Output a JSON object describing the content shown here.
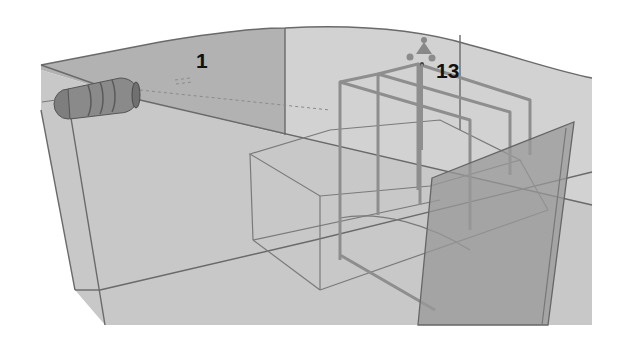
{
  "scene": {
    "type": "3d-render",
    "colors": {
      "background": "#ffffff",
      "floor": "#c9c9c9",
      "back_wall": "#b4b4b4",
      "right_wall": "#d0d0d0",
      "panel": "#9a9a9a",
      "edge": "#6a6a6a",
      "frame": "#8c8c8c",
      "label": "#111111"
    },
    "labels": [
      {
        "id": "camera",
        "text": "1"
      },
      {
        "id": "light",
        "text": "13"
      }
    ]
  }
}
